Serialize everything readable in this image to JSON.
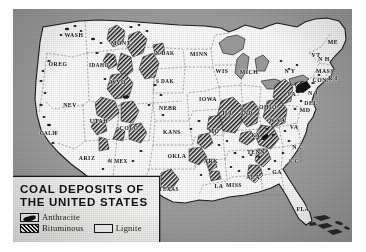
{
  "figure": {
    "kind": "printed-map",
    "caption_visible": false
  },
  "map": {
    "title_line1": "COAL DEPOSITS OF",
    "title_line2": "THE UNITED STATES",
    "region": "United States",
    "colors": {
      "ocean": "#9d9d9d",
      "land": "#fbfbfb",
      "ink": "#161616",
      "stateline": "#6d6d6d",
      "legend_bg": "#f4f4f2"
    }
  },
  "legend": {
    "items": [
      {
        "label": "Anthracite",
        "swatch": "solid-black-blob"
      },
      {
        "label": "Bituminous",
        "swatch": "cross-hatch"
      },
      {
        "label": "Lignite",
        "swatch": "empty-outline"
      }
    ]
  },
  "state_labels": [
    {
      "text": "WASH",
      "x": 61,
      "y": 26
    },
    {
      "text": "OREG",
      "x": 45,
      "y": 55
    },
    {
      "text": "IDAHO",
      "x": 86,
      "y": 56
    },
    {
      "text": "NEV",
      "x": 57,
      "y": 96
    },
    {
      "text": "CALIF",
      "x": 36,
      "y": 124
    },
    {
      "text": "UTAH",
      "x": 86,
      "y": 112
    },
    {
      "text": "ARIZ",
      "x": 74,
      "y": 149
    },
    {
      "text": "MONT",
      "x": 108,
      "y": 34
    },
    {
      "text": "WYO",
      "x": 105,
      "y": 73
    },
    {
      "text": "COLO",
      "x": 116,
      "y": 119
    },
    {
      "text": "N MEX",
      "x": 105,
      "y": 152
    },
    {
      "text": "N DAK",
      "x": 152,
      "y": 44
    },
    {
      "text": "S DAK",
      "x": 152,
      "y": 72
    },
    {
      "text": "NEBR",
      "x": 155,
      "y": 99
    },
    {
      "text": "KANS",
      "x": 159,
      "y": 123
    },
    {
      "text": "OKLA",
      "x": 164,
      "y": 147
    },
    {
      "text": "TEXAS",
      "x": 156,
      "y": 180
    },
    {
      "text": "MINN",
      "x": 186,
      "y": 45
    },
    {
      "text": "IOWA",
      "x": 195,
      "y": 90
    },
    {
      "text": "MO",
      "x": 201,
      "y": 122
    },
    {
      "text": "ARK",
      "x": 198,
      "y": 152
    },
    {
      "text": "LA",
      "x": 206,
      "y": 177
    },
    {
      "text": "WIS",
      "x": 209,
      "y": 62
    },
    {
      "text": "ILL",
      "x": 215,
      "y": 104
    },
    {
      "text": "MISS",
      "x": 221,
      "y": 176
    },
    {
      "text": "MICH",
      "x": 236,
      "y": 63
    },
    {
      "text": "IND",
      "x": 234,
      "y": 104
    },
    {
      "text": "KY",
      "x": 243,
      "y": 126
    },
    {
      "text": "TENN",
      "x": 243,
      "y": 143
    },
    {
      "text": "ALA",
      "x": 240,
      "y": 168
    },
    {
      "text": "OHIO",
      "x": 255,
      "y": 98
    },
    {
      "text": "GA",
      "x": 264,
      "y": 163
    },
    {
      "text": "FLA",
      "x": 290,
      "y": 200
    },
    {
      "text": "N Y",
      "x": 277,
      "y": 62
    },
    {
      "text": "PA",
      "x": 279,
      "y": 85
    },
    {
      "text": "W VA",
      "x": 264,
      "y": 111
    },
    {
      "text": "VA",
      "x": 281,
      "y": 118
    },
    {
      "text": "N C",
      "x": 285,
      "y": 138
    },
    {
      "text": "S C",
      "x": 281,
      "y": 152
    },
    {
      "text": "MD",
      "x": 292,
      "y": 101
    },
    {
      "text": "DEL",
      "x": 298,
      "y": 94
    },
    {
      "text": "N J",
      "x": 300,
      "y": 84
    },
    {
      "text": "VT",
      "x": 303,
      "y": 46
    },
    {
      "text": "N H",
      "x": 311,
      "y": 50
    },
    {
      "text": "ME",
      "x": 320,
      "y": 33
    },
    {
      "text": "MASS",
      "x": 312,
      "y": 62
    },
    {
      "text": "CONN",
      "x": 309,
      "y": 71
    },
    {
      "text": "R I",
      "x": 320,
      "y": 69
    }
  ]
}
